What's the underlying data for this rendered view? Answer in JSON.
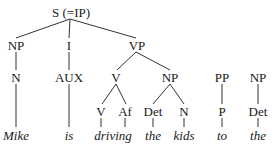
{
  "diagram": {
    "type": "syntax-tree",
    "root": {
      "label": "S (=IP)"
    },
    "level1": [
      {
        "label": "NP"
      },
      {
        "label": "I"
      },
      {
        "label": "VP"
      }
    ],
    "level2": [
      {
        "label": "N"
      },
      {
        "label": "AUX"
      },
      {
        "label": "V"
      },
      {
        "label": "NP"
      },
      {
        "label": "PP"
      },
      {
        "label": "NP"
      }
    ],
    "level3": [
      {
        "label": "V"
      },
      {
        "label": "Af"
      },
      {
        "label": "Det"
      },
      {
        "label": "N"
      },
      {
        "label": "P"
      },
      {
        "label": "Det"
      }
    ],
    "words": [
      {
        "text": "Mike"
      },
      {
        "text": "is"
      },
      {
        "text": "driving"
      },
      {
        "text": "the"
      },
      {
        "text": "kids"
      },
      {
        "text": "to"
      },
      {
        "text": "the"
      }
    ]
  }
}
